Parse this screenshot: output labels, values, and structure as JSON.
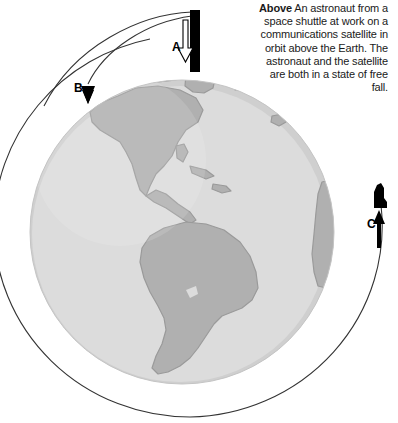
{
  "figure": {
    "background_color": "#ffffff",
    "width": 398,
    "height": 423
  },
  "caption": {
    "lead": "Above",
    "body": " An astronaut from a space shuttle at work on a communications satellite in orbit above the Earth. The astronaut and the satellite are both in a state of free fall.",
    "align": "right"
  },
  "markers": [
    {
      "id": "A",
      "label": "A",
      "arrow": "down",
      "description": "Shuttle and astronaut at top of orbit, arrow pointing down toward Earth"
    },
    {
      "id": "B",
      "label": "B",
      "arrow": "down",
      "description": "Trajectory arrow falling toward the Earth at upper left"
    },
    {
      "id": "C",
      "label": "C",
      "arrow": "up",
      "description": "Satellite continuing along the orbital path at right"
    }
  ],
  "earth": {
    "name": "earth-globe",
    "center_x": 182,
    "center_y": 232,
    "radius": 152,
    "ocean_color": "#dcdcdc",
    "land_color": "#b0b0b0",
    "land_outline_color": "#9a9a9a",
    "limb_color": "#c9c9c9"
  },
  "orbit": {
    "name": "orbit-path",
    "stroke_color": "#333333",
    "stroke_width": 1,
    "center_x": 190,
    "center_y": 226,
    "radius_x": 196,
    "radius_y": 191
  },
  "trajectories": [
    {
      "name": "fall-arc-outer",
      "from": "A",
      "to": "B",
      "stroke_color": "#333333"
    },
    {
      "name": "fall-arc-inner",
      "from": "A",
      "to": "B",
      "stroke_color": "#333333"
    }
  ],
  "spacecraft": {
    "shuttle_color": "#000000",
    "arrow_fill": "#ffffff",
    "arrow_stroke": "#000000",
    "satellite_color": "#000000"
  }
}
